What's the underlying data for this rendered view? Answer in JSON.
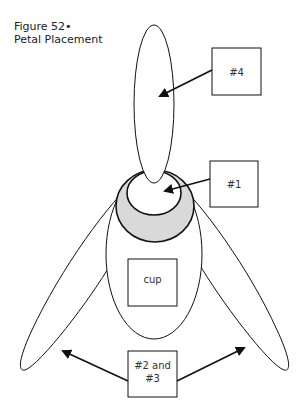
{
  "caption": {
    "line1": "Figure 52•",
    "line2": "Petal Placement"
  },
  "labels": {
    "petal4": "#4",
    "petal1": "#1",
    "cup": "cup",
    "petals23_line1": "#2 and",
    "petals23_line2": "#3"
  },
  "colors": {
    "stroke": "#111111",
    "ring_fill": "#d9d9d9",
    "background": "#ffffff"
  }
}
